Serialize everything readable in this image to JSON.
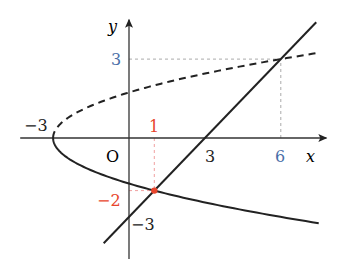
{
  "chart_data": {
    "type": "line",
    "title": "",
    "xlabel": "x",
    "ylabel": "y",
    "origin_label": "O",
    "xlim": [
      -4.3,
      7.8
    ],
    "ylim": [
      -4.6,
      4.5
    ],
    "grid": false,
    "series": [
      {
        "name": "parabola upper branch (y = sqrt(x+3))",
        "style": "dashed",
        "color": "#222222",
        "equation": "x = y^2 - 3, y >= 0",
        "x_range": [
          -3,
          7.5
        ]
      },
      {
        "name": "parabola lower branch (y = -sqrt(x+3))",
        "style": "solid",
        "color": "#222222",
        "equation": "x = y^2 - 3, y <= 0",
        "x_range": [
          -3,
          7.5
        ]
      },
      {
        "name": "line y = x - 3",
        "style": "solid",
        "color": "#222222",
        "equation": "y = x - 3",
        "x_range": [
          -1,
          7.4
        ]
      }
    ],
    "points": [
      {
        "label": "(1, -2)",
        "x": 1,
        "y": -2,
        "color": "#e8452c"
      },
      {
        "label": "(6, 3)",
        "x": 6,
        "y": 3,
        "color": "#222222"
      }
    ],
    "guides": [
      {
        "from": [
          1,
          0
        ],
        "to": [
          1,
          -2
        ],
        "color": "#f0a0a0"
      },
      {
        "from": [
          0,
          -2
        ],
        "to": [
          1,
          -2
        ],
        "color": "#f0a0a0"
      },
      {
        "from": [
          0,
          3
        ],
        "to": [
          6,
          3
        ],
        "color": "#aaaaaa"
      },
      {
        "from": [
          6,
          0
        ],
        "to": [
          6,
          3
        ],
        "color": "#aaaaaa"
      }
    ],
    "tick_labels": [
      {
        "text": "−3",
        "at": "x",
        "value": -3,
        "color": "#222222"
      },
      {
        "text": "3",
        "at": "x",
        "value": 3,
        "color": "#222222"
      },
      {
        "text": "6",
        "at": "x",
        "value": 6,
        "color": "#4a6fa8"
      },
      {
        "text": "1",
        "at": "x",
        "value": 1,
        "color": "#e8452c"
      },
      {
        "text": "3",
        "at": "y",
        "value": 3,
        "color": "#4a6fa8"
      },
      {
        "text": "−2",
        "at": "y",
        "value": -2,
        "color": "#e8452c"
      },
      {
        "text": "−3",
        "at": "y",
        "value": -3,
        "color": "#222222"
      }
    ]
  }
}
